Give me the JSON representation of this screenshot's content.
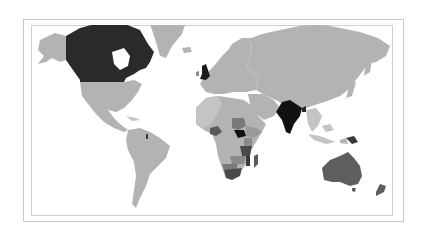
{
  "map": {
    "projection": "world-miller-like",
    "style": "grayscale choropleth",
    "colors": {
      "background": "#ffffff",
      "frame": "#c8c8c8",
      "base_land": "#b3b3b3",
      "light": "#c4c4c4",
      "medium": "#8a8a8a",
      "dark": "#5a5a5a",
      "darkest": "#1a1a1a"
    },
    "highlighted_regions": [
      {
        "name": "Canada",
        "shade": "darkest"
      },
      {
        "name": "United Kingdom",
        "shade": "darkest"
      },
      {
        "name": "India",
        "shade": "darkest"
      },
      {
        "name": "South Sudan",
        "shade": "darkest"
      },
      {
        "name": "Australia",
        "shade": "dark"
      },
      {
        "name": "New Zealand",
        "shade": "dark"
      },
      {
        "name": "Papua New Guinea",
        "shade": "dark"
      },
      {
        "name": "South Africa",
        "shade": "dark"
      },
      {
        "name": "Kenya",
        "shade": "medium"
      },
      {
        "name": "Tanzania",
        "shade": "dark"
      },
      {
        "name": "Zambia",
        "shade": "medium"
      },
      {
        "name": "Nigeria",
        "shade": "dark"
      },
      {
        "name": "Madagascar",
        "shade": "dark"
      },
      {
        "name": "Sudan",
        "shade": "medium"
      }
    ]
  }
}
